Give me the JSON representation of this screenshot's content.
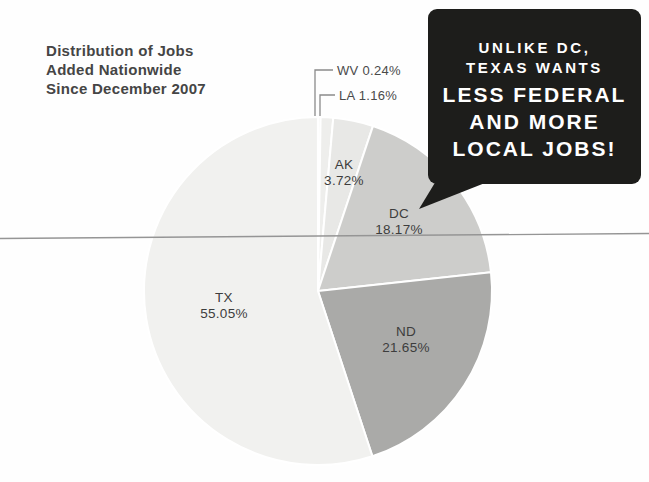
{
  "page": {
    "background": "#fefefe"
  },
  "title": {
    "lines": [
      "Distribution of Jobs",
      "Added Nationwide",
      "Since December 2007"
    ],
    "color": "#454545"
  },
  "chart_data": {
    "type": "pie",
    "title": "Distribution of Jobs Added Nationwide Since December 2007",
    "value_unit": "%",
    "start_angle": "12-oclock",
    "direction": "clockwise",
    "legend_position": "none",
    "center": {
      "x": 318,
      "y": 291
    },
    "radius": 174,
    "slice_border_color": "#ffffff",
    "slices": [
      {
        "id": "wv",
        "label": "WV",
        "value": 0.24,
        "pct_text": "0.24%",
        "color": "#f3f3f1",
        "label_mode": "leader",
        "label_x": 337,
        "label_y": 70,
        "leader_points": "315,116 315,70 333,70"
      },
      {
        "id": "la",
        "label": "LA",
        "value": 1.16,
        "pct_text": "1.16%",
        "color": "#eeeeec",
        "label_mode": "leader",
        "label_x": 339,
        "label_y": 95,
        "leader_points": "320,116 320,95 335,95"
      },
      {
        "id": "ak",
        "label": "AK",
        "value": 3.72,
        "pct_text": "3.72%",
        "color": "#e8e8e6",
        "label_mode": "inside",
        "label_x": 344,
        "label_y": 173
      },
      {
        "id": "dc",
        "label": "DC",
        "value": 18.17,
        "pct_text": "18.17%",
        "color": "#cdcdcb",
        "label_mode": "inside",
        "label_x": 399,
        "label_y": 222
      },
      {
        "id": "nd",
        "label": "ND",
        "value": 21.65,
        "pct_text": "21.65%",
        "color": "#aaaaa8",
        "label_mode": "inside",
        "label_x": 406,
        "label_y": 340
      },
      {
        "id": "tx",
        "label": "TX",
        "value": 55.05,
        "pct_text": "55.05%",
        "color": "#f1f1ef",
        "label_mode": "inside",
        "label_x": 224,
        "label_y": 306
      }
    ]
  },
  "divider": {
    "color": "#959595",
    "y_left": 238.5,
    "y_right": 233.5
  },
  "leader_line_color": "#8a8a8a",
  "callout": {
    "background": "#1d1d1b",
    "text_color": "#ffffff",
    "lines_small": [
      "UNLIKE DC,",
      "TEXAS WANTS"
    ],
    "lines_large": [
      "LESS FEDERAL",
      "AND MORE",
      "LOCAL JOBS!"
    ],
    "tail_points": "436,181 490,181 419,209"
  }
}
